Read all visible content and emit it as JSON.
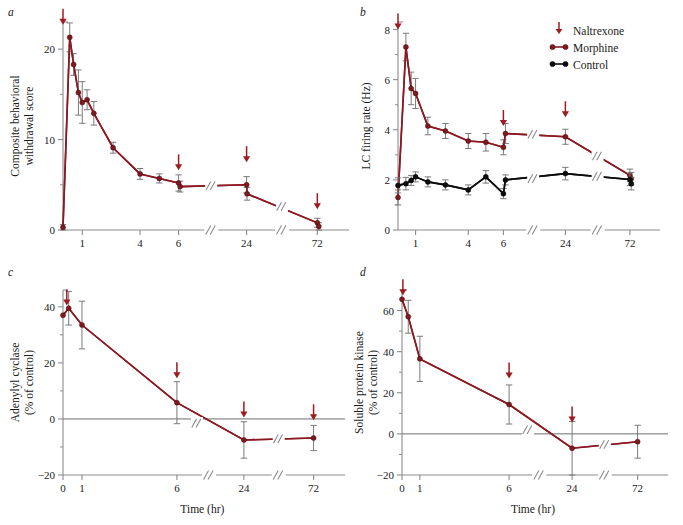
{
  "figure": {
    "panels": [
      "a",
      "b",
      "c",
      "d"
    ],
    "colors": {
      "morphine": "#8c1a22",
      "control": "#0d0d0d",
      "naltrexone_arrow": "#9e1b20",
      "axis": "#8c8c8c",
      "errorbar": "#7a7a7a"
    },
    "legend": {
      "position": "top-right-of-panel-b",
      "items": [
        {
          "label": "Naltrexone",
          "marker": "down-arrow",
          "color": "#9e1b20"
        },
        {
          "label": "Morphine",
          "marker": "line-with-circles",
          "color": "#8c1a22"
        },
        {
          "label": "Control",
          "marker": "line-with-circles",
          "color": "#0d0d0d"
        }
      ]
    }
  },
  "chart_data": [
    {
      "panel": "a",
      "type": "line",
      "title": "",
      "ylabel": "Composite behavioral withdrawal score",
      "xlabel": "",
      "ylim": [
        0,
        23
      ],
      "yticks": [
        0,
        10,
        20
      ],
      "yticklabels": [
        "0",
        "10",
        "20"
      ],
      "yminorticks": [
        5,
        15
      ],
      "xticklabels": [
        "1",
        "4",
        "6",
        "24",
        "72"
      ],
      "xbreaks": [
        "between 6 and 24",
        "between 24 and 72"
      ],
      "grid": false,
      "series": [
        {
          "name": "Morphine",
          "color": "#8c1a22",
          "points": [
            {
              "x": 0.0,
              "y": 0.3,
              "err": 0.3
            },
            {
              "x": 0.35,
              "y": 21.3,
              "err": 1.6
            },
            {
              "x": 0.55,
              "y": 18.3,
              "err": 1.2
            },
            {
              "x": 0.8,
              "y": 15.2,
              "err": 2.5
            },
            {
              "x": 1.0,
              "y": 14.1,
              "err": 2.3
            },
            {
              "x": 1.25,
              "y": 14.4,
              "err": 1.1
            },
            {
              "x": 1.6,
              "y": 12.9,
              "err": 1.3
            },
            {
              "x": 2.6,
              "y": 9.1,
              "err": 0.6
            },
            {
              "x": 4.0,
              "y": 6.2,
              "err": 0.6
            },
            {
              "x": 5.0,
              "y": 5.7,
              "err": 0.5
            },
            {
              "x": 6.0,
              "y": 5.2,
              "err": 0.9
            },
            {
              "x": 6.4,
              "y": 4.8,
              "err": 0.6
            },
            {
              "x": 24.0,
              "y": 5.0,
              "err": 0.9
            },
            {
              "x": 24.3,
              "y": 4.0,
              "err": 0.7
            },
            {
              "x": 72.0,
              "y": 0.8,
              "err": 0.5
            },
            {
              "x": 73.0,
              "y": 0.4,
              "err": 0.4
            }
          ]
        }
      ],
      "naltrexone_arrows": [
        {
          "x": 0.0,
          "y": 22.7
        },
        {
          "x": 6.0,
          "y": 6.6
        },
        {
          "x": 24.0,
          "y": 7.5
        },
        {
          "x": 72.0,
          "y": 2.3
        }
      ]
    },
    {
      "panel": "b",
      "type": "line",
      "title": "",
      "ylabel": "LC firing rate (Hz)",
      "xlabel": "",
      "ylim": [
        0,
        8.3
      ],
      "yticks": [
        0,
        2,
        4,
        6,
        8
      ],
      "yticklabels": [
        "0",
        "2",
        "4",
        "6",
        "8"
      ],
      "yminorticks": [
        1,
        3,
        5,
        7
      ],
      "xticklabels": [
        "1",
        "4",
        "6",
        "24",
        "72"
      ],
      "xbreaks": [
        "between 6 and 24",
        "between 24 and 72"
      ],
      "grid": false,
      "series": [
        {
          "name": "Morphine",
          "color": "#8c1a22",
          "points": [
            {
              "x": 0.0,
              "y": 1.3,
              "err": 0.3
            },
            {
              "x": 0.45,
              "y": 7.3,
              "err": 0.55
            },
            {
              "x": 0.75,
              "y": 5.65,
              "err": 0.65
            },
            {
              "x": 1.0,
              "y": 5.45,
              "err": 0.6
            },
            {
              "x": 1.7,
              "y": 4.15,
              "err": 0.35
            },
            {
              "x": 2.7,
              "y": 3.95,
              "err": 0.3
            },
            {
              "x": 4.0,
              "y": 3.55,
              "err": 0.3
            },
            {
              "x": 5.0,
              "y": 3.5,
              "err": 0.35
            },
            {
              "x": 6.0,
              "y": 3.3,
              "err": 0.3
            },
            {
              "x": 6.6,
              "y": 3.85,
              "err": 0.4
            },
            {
              "x": 24.0,
              "y": 3.72,
              "err": 0.3
            },
            {
              "x": 72.0,
              "y": 2.18,
              "err": 0.25
            },
            {
              "x": 73.0,
              "y": 2.05,
              "err": 0.25
            }
          ]
        },
        {
          "name": "Control",
          "color": "#0d0d0d",
          "points": [
            {
              "x": 0.0,
              "y": 1.78,
              "err": 0.3
            },
            {
              "x": 0.45,
              "y": 1.85,
              "err": 0.25
            },
            {
              "x": 0.75,
              "y": 1.98,
              "err": 0.2
            },
            {
              "x": 1.0,
              "y": 2.12,
              "err": 0.2
            },
            {
              "x": 1.7,
              "y": 1.92,
              "err": 0.2
            },
            {
              "x": 2.7,
              "y": 1.8,
              "err": 0.2
            },
            {
              "x": 4.0,
              "y": 1.6,
              "err": 0.2
            },
            {
              "x": 5.0,
              "y": 2.12,
              "err": 0.25
            },
            {
              "x": 6.0,
              "y": 1.45,
              "err": 0.2
            },
            {
              "x": 6.6,
              "y": 2.0,
              "err": 0.2
            },
            {
              "x": 24.0,
              "y": 2.25,
              "err": 0.25
            },
            {
              "x": 72.0,
              "y": 2.02,
              "err": 0.25
            },
            {
              "x": 73.0,
              "y": 1.85,
              "err": 0.25
            }
          ]
        }
      ],
      "naltrexone_arrows": [
        {
          "x": 0.0,
          "y": 8.0
        },
        {
          "x": 6.0,
          "y": 4.15
        },
        {
          "x": 24.0,
          "y": 4.5
        }
      ]
    },
    {
      "panel": "c",
      "type": "line",
      "title": "",
      "ylabel": "Adenylyl cyclase (% of control)",
      "xlabel": "Time (hr)",
      "ylim": [
        -20,
        46
      ],
      "yticks": [
        -20,
        0,
        20,
        40
      ],
      "yticklabels": [
        "−20",
        "0",
        "20",
        "40"
      ],
      "yminorticks": [
        -10,
        10,
        30
      ],
      "xticklabels": [
        "0",
        "1",
        "6",
        "24",
        "72"
      ],
      "xbreaks": [
        "between 6 and 24",
        "between 24 and 72"
      ],
      "grid": false,
      "series": [
        {
          "name": "Adenylyl cyclase",
          "color": "#8c1a22",
          "points": [
            {
              "x": 0.0,
              "y": 37.0,
              "err": 0.0
            },
            {
              "x": 0.3,
              "y": 39.5,
              "err": 6.0
            },
            {
              "x": 1.0,
              "y": 33.5,
              "err": 8.5
            },
            {
              "x": 6.0,
              "y": 5.8,
              "err": 7.5
            },
            {
              "x": 24.0,
              "y": -7.5,
              "err": 6.5
            },
            {
              "x": 72.0,
              "y": -6.8,
              "err": 4.5
            }
          ]
        }
      ],
      "naltrexone_arrows": [
        {
          "x": 0.2,
          "y": 40.5
        },
        {
          "x": 6.0,
          "y": 14.5
        },
        {
          "x": 24.0,
          "y": 0.5
        },
        {
          "x": 72.0,
          "y": -0.5
        }
      ]
    },
    {
      "panel": "d",
      "type": "line",
      "title": "",
      "ylabel": "Soluble protein kinase (% of control)",
      "xlabel": "Time (hr)",
      "ylim": [
        -20,
        70
      ],
      "yticks": [
        -20,
        0,
        20,
        40,
        60
      ],
      "yticklabels": [
        "−20",
        "0",
        "20",
        "40",
        "60"
      ],
      "yminorticks": [
        -10,
        10,
        30,
        50
      ],
      "xticklabels": [
        "0",
        "1",
        "6",
        "24",
        "72"
      ],
      "xbreaks": [
        "between 6 and 24",
        "between 24 and 72"
      ],
      "grid": false,
      "series": [
        {
          "name": "Soluble protein kinase",
          "color": "#8c1a22",
          "points": [
            {
              "x": 0.0,
              "y": 65.5,
              "err": 0.0
            },
            {
              "x": 0.35,
              "y": 57.0,
              "err": 8.0
            },
            {
              "x": 1.0,
              "y": 36.5,
              "err": 11.0
            },
            {
              "x": 6.0,
              "y": 14.3,
              "err": 9.5
            },
            {
              "x": 24.0,
              "y": -7.0,
              "err": 13.0
            },
            {
              "x": 72.0,
              "y": -3.8,
              "err": 8.0
            }
          ]
        }
      ],
      "naltrexone_arrows": [
        {
          "x": 0.05,
          "y": 67.5
        },
        {
          "x": 6.0,
          "y": 27.0
        },
        {
          "x": 24.0,
          "y": 5.5
        }
      ]
    }
  ]
}
